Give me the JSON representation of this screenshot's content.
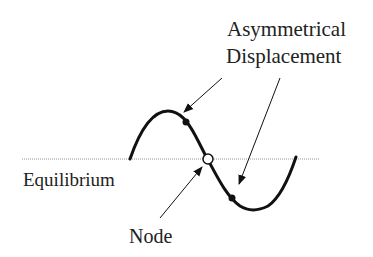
{
  "diagram": {
    "labels": {
      "asym_line1": "Asymmetrical",
      "asym_line2": "Displacement",
      "equilibrium": "Equilibrium",
      "node": "Node"
    },
    "colors": {
      "line": "#111111",
      "equilibrium": "#888888",
      "background": "#ffffff"
    }
  }
}
